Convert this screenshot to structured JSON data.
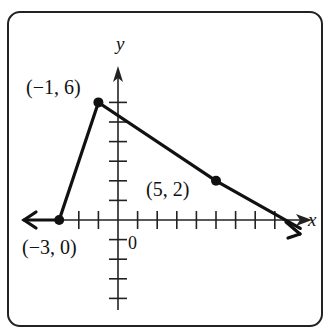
{
  "chart_data": {
    "type": "line",
    "title": "",
    "xlabel": "x",
    "ylabel": "y",
    "origin_label": "0",
    "xlim": [
      -4,
      9
    ],
    "ylim": [
      -4,
      7
    ],
    "grid": false,
    "series": [
      {
        "name": "graph",
        "x": [
          -3,
          -1,
          5
        ],
        "y": [
          0,
          6,
          2
        ],
        "left_ray": "extends left from (-3, 0) along y = 0",
        "right_ray": "continues through (5, 2) with slope -1/3"
      }
    ],
    "points": [
      {
        "x": -1,
        "y": 6,
        "label": "(−1, 6)"
      },
      {
        "x": 5,
        "y": 2,
        "label": "(5, 2)"
      },
      {
        "x": -3,
        "y": 0,
        "label": "(−3, 0)"
      }
    ]
  },
  "colors": {
    "ink": "#111111",
    "background": "#ffffff"
  }
}
